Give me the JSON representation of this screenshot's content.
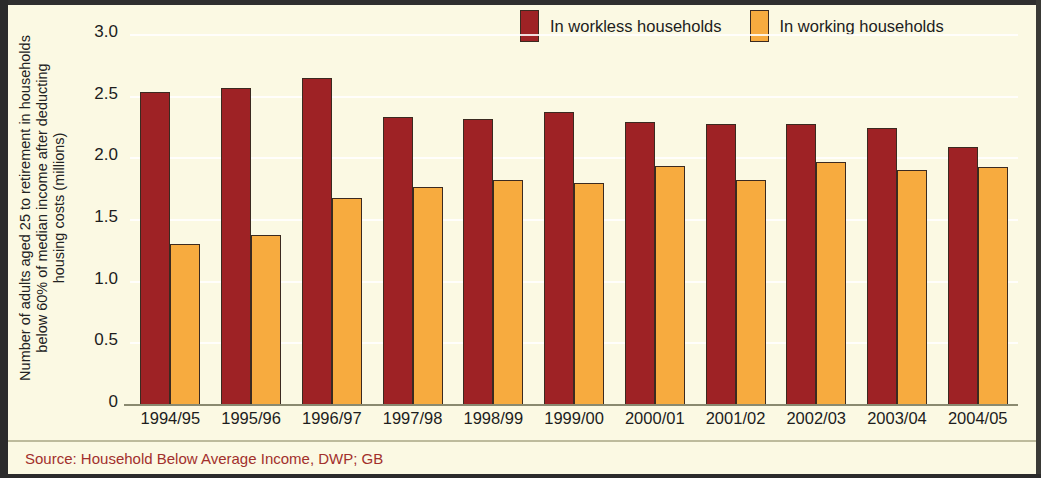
{
  "colors": {
    "workless": "#9e2225",
    "working": "#f7ab3f",
    "background": "#fbf9e3",
    "source_text": "#a2302c",
    "axis_text": "#1d1d1d"
  },
  "legend": {
    "items": [
      {
        "label": "In workless households",
        "color": "#9e2225"
      },
      {
        "label": "In working households",
        "color": "#f7ab3f"
      }
    ]
  },
  "axis": {
    "y_title_line1": "Number of adults aged 25 to retirement in households",
    "y_title_line2": "below 60% of median income after deducting",
    "y_title_line3": "housing costs (millions)",
    "y_ticks": [
      "3.0",
      "2.5",
      "2.0",
      "1.5",
      "1.0",
      "0.5",
      "0"
    ]
  },
  "footer": {
    "source": "Source: Household Below Average Income, DWP; GB"
  },
  "chart_data": {
    "type": "bar",
    "title": "",
    "subtitle": "",
    "xlabel": "",
    "ylabel": "Number of adults aged 25 to retirement in households below 60% of median income after deducting housing costs (millions)",
    "ylim": [
      0,
      3.0
    ],
    "ytick_values": [
      3.0,
      2.5,
      2.0,
      1.5,
      1.0,
      0.5,
      0
    ],
    "grid": true,
    "legend_position": "top-right",
    "categories": [
      "1994/95",
      "1995/96",
      "1996/97",
      "1997/98",
      "1998/99",
      "1999/00",
      "2000/01",
      "2001/02",
      "2002/03",
      "2003/04",
      "2004/05"
    ],
    "series": [
      {
        "name": "In workless households",
        "color": "#9e2225",
        "values": [
          2.53,
          2.56,
          2.64,
          2.33,
          2.31,
          2.37,
          2.29,
          2.27,
          2.27,
          2.24,
          2.08
        ]
      },
      {
        "name": "In working households",
        "color": "#f7ab3f",
        "values": [
          1.3,
          1.37,
          1.67,
          1.76,
          1.82,
          1.79,
          1.93,
          1.82,
          1.96,
          1.9,
          1.92
        ]
      }
    ],
    "source": "Source: Household Below Average Income, DWP; GB"
  }
}
